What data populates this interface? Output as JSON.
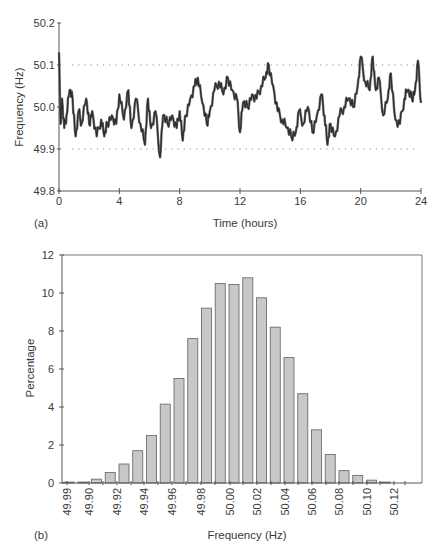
{
  "figure": {
    "panel_a_label": "(a)",
    "panel_b_label": "(b)"
  },
  "chart_data": [
    {
      "type": "line",
      "panel": "(a)",
      "title": "",
      "xlabel": "Time (hours)",
      "ylabel": "Frequency (Hz)",
      "xlim": [
        0,
        24
      ],
      "ylim": [
        49.8,
        50.2
      ],
      "xticks": [
        "0",
        "4",
        "8",
        "12",
        "16",
        "20",
        "24"
      ],
      "yticks": [
        "49.8",
        "49.9",
        "50.0",
        "50.1",
        "50.2"
      ],
      "reference_lines": [
        {
          "y": 50.1,
          "style": "dotted"
        },
        {
          "y": 49.9,
          "style": "dotted"
        }
      ],
      "grid": false,
      "series": [
        {
          "name": "Frequency",
          "x": [
            0,
            0.1,
            0.2,
            0.35,
            0.5,
            0.7,
            0.9,
            1.1,
            1.3,
            1.5,
            1.8,
            2.0,
            2.2,
            2.5,
            2.8,
            3.0,
            3.2,
            3.5,
            3.8,
            4.0,
            4.3,
            4.6,
            4.8,
            5.1,
            5.4,
            5.7,
            5.9,
            6.1,
            6.4,
            6.7,
            6.9,
            7.2,
            7.5,
            7.8,
            8.0,
            8.2,
            8.4,
            8.7,
            9.0,
            9.2,
            9.5,
            9.8,
            10.0,
            10.3,
            10.6,
            10.9,
            11.2,
            11.5,
            11.8,
            12.0,
            12.2,
            12.5,
            12.8,
            13.1,
            13.4,
            13.7,
            13.9,
            14.2,
            14.5,
            14.8,
            15.1,
            15.4,
            15.7,
            15.9,
            16.2,
            16.5,
            16.8,
            17.1,
            17.4,
            17.6,
            17.8,
            18.0,
            18.3,
            18.6,
            18.9,
            19.2,
            19.5,
            19.8,
            20.0,
            20.3,
            20.6,
            20.8,
            21.0,
            21.2,
            21.5,
            21.8,
            22.0,
            22.3,
            22.6,
            22.9,
            23.1,
            23.4,
            23.6,
            23.8,
            24.0
          ],
          "y": [
            50.13,
            49.96,
            50.02,
            49.95,
            49.98,
            50.04,
            50.02,
            49.93,
            49.99,
            49.96,
            50.02,
            49.96,
            49.99,
            49.93,
            49.97,
            49.93,
            49.96,
            49.98,
            49.96,
            50.03,
            49.97,
            50.04,
            49.95,
            50.02,
            49.96,
            49.91,
            50.02,
            49.95,
            49.99,
            49.88,
            49.98,
            49.96,
            49.98,
            49.95,
            49.99,
            49.92,
            49.98,
            50.02,
            50.05,
            50.07,
            50.01,
            49.96,
            49.99,
            50.04,
            50.06,
            50.03,
            50.07,
            50.04,
            50.02,
            49.94,
            50.01,
            50.0,
            50.03,
            50.02,
            50.05,
            50.07,
            50.1,
            50.05,
            49.99,
            49.97,
            49.95,
            49.93,
            49.94,
            49.99,
            49.96,
            50.0,
            49.94,
            49.98,
            50.03,
            49.98,
            49.91,
            49.96,
            49.93,
            49.98,
            50.0,
            50.02,
            50.0,
            50.05,
            50.12,
            50.06,
            50.04,
            50.12,
            50.04,
            50.07,
            49.98,
            50.02,
            50.08,
            49.97,
            49.96,
            50.02,
            50.04,
            50.02,
            50.04,
            50.11,
            50.01
          ]
        }
      ]
    },
    {
      "type": "bar",
      "panel": "(b)",
      "title": "",
      "xlabel": "Frequency (Hz)",
      "ylabel": "Percentage",
      "ylim": [
        0,
        12
      ],
      "yticks": [
        "0",
        "2",
        "4",
        "6",
        "8",
        "10",
        "12"
      ],
      "xtick_labels": [
        "49.99",
        "49.90",
        "49.92",
        "49.94",
        "49.96",
        "49.98",
        "50.00",
        "50.02",
        "50.04",
        "50.06",
        "50.08",
        "50.10",
        "50.12"
      ],
      "grid": false,
      "bar_color": "#c8c8c8",
      "categories": [
        "49.885",
        "49.895",
        "49.905",
        "49.915",
        "49.925",
        "49.935",
        "49.945",
        "49.955",
        "49.965",
        "49.975",
        "49.985",
        "49.995",
        "50.005",
        "50.015",
        "50.025",
        "50.035",
        "50.045",
        "50.055",
        "50.065",
        "50.075",
        "50.085",
        "50.095",
        "50.105",
        "50.115"
      ],
      "values": [
        0.05,
        0.05,
        0.2,
        0.55,
        1.0,
        1.7,
        2.5,
        4.15,
        5.5,
        7.6,
        9.2,
        10.5,
        10.45,
        10.8,
        9.75,
        8.2,
        6.6,
        4.7,
        2.8,
        1.5,
        0.65,
        0.4,
        0.15,
        0.05
      ]
    }
  ]
}
